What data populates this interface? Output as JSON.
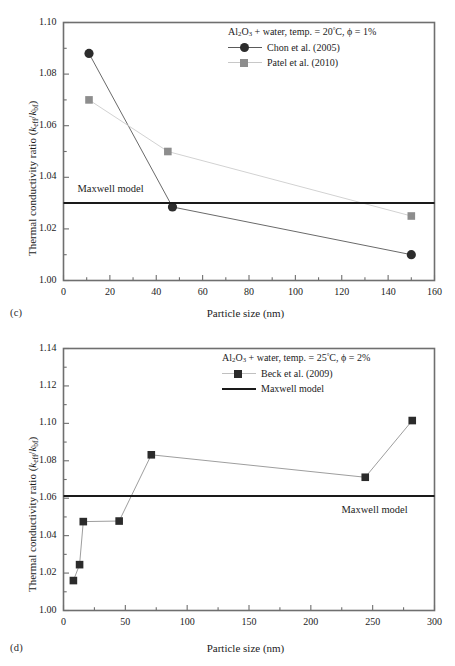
{
  "figure": {
    "panels": [
      {
        "id": "c",
        "label": "(c)",
        "condition": "Al2O3 + water, temp. = 20°C, ϕ = 1%",
        "maxwell_note": "Maxwell model",
        "axis": {
          "xlabel": "Particle size (nm)",
          "ylabel": "Thermal conductivity ratio (keff/kbf)",
          "xlim": [
            0,
            160
          ],
          "ylim": [
            1.0,
            1.1
          ],
          "xticks": [
            0,
            20,
            40,
            60,
            80,
            100,
            120,
            140,
            160
          ],
          "xticklabels": [
            "0",
            "20",
            "40",
            "60",
            "80",
            "100",
            "120",
            "140",
            "160"
          ],
          "yticks": [
            1.0,
            1.02,
            1.04,
            1.06,
            1.08,
            1.1
          ],
          "yticklabels": [
            "1.00",
            "1.02",
            "1.04",
            "1.06",
            "1.08",
            "1.10"
          ],
          "xminor": 10,
          "yminor": 0.01
        },
        "legend_entries": [
          {
            "label": "Chon et al. (2005)",
            "marker": "circle",
            "color": "#2c2c2c",
            "linecolor": "#5a5a5a"
          },
          {
            "label": "Patel et al. (2010)",
            "marker": "square",
            "color": "#8d8d8d",
            "linecolor": "#c2c2c2"
          }
        ]
      },
      {
        "id": "d",
        "label": "(d)",
        "condition": "Al2O3 + water, temp. = 25°C, ϕ = 2%",
        "maxwell_note": "Maxwell model",
        "axis": {
          "xlabel": "Particle size (nm)",
          "ylabel": "Thermal conductivity ratio (keff/kbf)",
          "xlim": [
            0,
            300
          ],
          "ylim": [
            1.0,
            1.14
          ],
          "xticks": [
            0,
            50,
            100,
            150,
            200,
            250,
            300
          ],
          "xticklabels": [
            "0",
            "50",
            "100",
            "150",
            "200",
            "250",
            "300"
          ],
          "yticks": [
            1.0,
            1.02,
            1.04,
            1.06,
            1.08,
            1.1,
            1.12,
            1.14
          ],
          "yticklabels": [
            "1.00",
            "1.02",
            "1.04",
            "1.06",
            "1.08",
            "1.10",
            "1.12",
            "1.14"
          ],
          "xminor": 25,
          "yminor": 0.01
        },
        "legend_entries": [
          {
            "label": "Beck et al. (2009)",
            "marker": "square",
            "color": "#2b2b2b",
            "linecolor": "#b5b5b5"
          },
          {
            "label": "Maxwell model",
            "marker": "line",
            "color": "#1a1a1a",
            "linecolor": "#1a1a1a"
          }
        ]
      }
    ]
  },
  "chart_data": [
    {
      "type": "line",
      "panel": "(c)",
      "title": "Al2O3 + water, temp. = 20°C, ϕ = 1%",
      "xlabel": "Particle size (nm)",
      "ylabel": "Thermal conductivity ratio (keff/kbf)",
      "xlim": [
        0,
        160
      ],
      "ylim": [
        1.0,
        1.1
      ],
      "xticks": [
        0,
        20,
        40,
        60,
        80,
        100,
        120,
        140,
        160
      ],
      "yticks": [
        1.0,
        1.02,
        1.04,
        1.06,
        1.08,
        1.1
      ],
      "grid": false,
      "legend_position": "top-right",
      "series": [
        {
          "name": "Chon et al. (2005)",
          "marker": "filled-circle",
          "color": "#2c2c2c",
          "x": [
            11,
            47,
            150
          ],
          "y": [
            1.088,
            1.0285,
            1.01
          ]
        },
        {
          "name": "Patel et al. (2010)",
          "marker": "filled-square",
          "color": "#8d8d8d",
          "x": [
            11,
            45,
            150
          ],
          "y": [
            1.07,
            1.05,
            1.025
          ]
        }
      ],
      "reference_lines": [
        {
          "name": "Maxwell model",
          "orientation": "horizontal",
          "value": 1.03,
          "color": "#1a1a1a",
          "label": "Maxwell model",
          "label_position": "left-above"
        }
      ]
    },
    {
      "type": "line",
      "panel": "(d)",
      "title": "Al2O3 + water, temp. = 25°C, ϕ = 2%",
      "xlabel": "Particle size (nm)",
      "ylabel": "Thermal conductivity ratio (keff/kbf)",
      "xlim": [
        0,
        300
      ],
      "ylim": [
        1.0,
        1.14
      ],
      "xticks": [
        0,
        50,
        100,
        150,
        200,
        250,
        300
      ],
      "yticks": [
        1.0,
        1.02,
        1.04,
        1.06,
        1.08,
        1.1,
        1.12,
        1.14
      ],
      "grid": false,
      "legend_position": "top-right",
      "series": [
        {
          "name": "Beck et al. (2009)",
          "marker": "filled-square",
          "color": "#2b2b2b",
          "x": [
            8,
            13,
            16,
            45,
            71,
            244,
            282
          ],
          "y": [
            1.016,
            1.0245,
            1.0475,
            1.0478,
            1.0832,
            1.0712,
            1.1015
          ]
        }
      ],
      "reference_lines": [
        {
          "name": "Maxwell model",
          "orientation": "horizontal",
          "value": 1.0612,
          "color": "#1a1a1a",
          "label": "Maxwell model",
          "label_position": "right-below"
        }
      ]
    }
  ]
}
